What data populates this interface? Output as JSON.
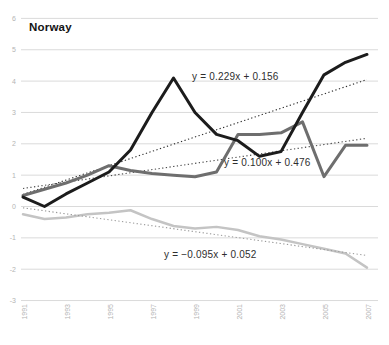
{
  "chart_data": {
    "type": "line",
    "title": "Norway",
    "x_axis": {
      "years": [
        1991,
        1992,
        1993,
        1994,
        1995,
        1996,
        1997,
        1998,
        1999,
        2000,
        2001,
        2002,
        2003,
        2004,
        2005,
        2006,
        2007
      ],
      "tick_labels": [
        "1991",
        "1993",
        "1995",
        "1997",
        "1999",
        "2001",
        "2003",
        "2005",
        "2007"
      ]
    },
    "y_axis": {
      "ticks": [
        6,
        5,
        4,
        3,
        2,
        1,
        0,
        -1,
        -2,
        -3
      ],
      "ylim": [
        -3,
        6
      ]
    },
    "grid": "horizontal",
    "series": [
      {
        "name": "series-black",
        "color": "#1c1c1c",
        "width": 3,
        "values": [
          0.3,
          0.0,
          0.4,
          0.75,
          1.1,
          1.8,
          3.0,
          4.1,
          3.0,
          2.3,
          2.1,
          1.6,
          1.75,
          3.0,
          4.2,
          4.6,
          4.85
        ],
        "trend": {
          "slope": 0.229,
          "intercept": 0.156,
          "label": "y = 0.229x + 0.156",
          "color": "#2e2e2e"
        }
      },
      {
        "name": "series-gray",
        "color": "#6e6e6e",
        "width": 3,
        "values": [
          0.35,
          0.55,
          0.75,
          1.0,
          1.3,
          1.15,
          1.05,
          1.0,
          0.95,
          1.1,
          2.3,
          2.3,
          2.35,
          2.7,
          0.95,
          1.95,
          1.95
        ],
        "trend": {
          "slope": 0.1,
          "intercept": 0.476,
          "label": "y = 0.100x + 0.476",
          "color": "#4a4a4a"
        }
      },
      {
        "name": "series-lightgray",
        "color": "#c4c4c4",
        "width": 2.5,
        "values": [
          -0.25,
          -0.4,
          -0.35,
          -0.25,
          -0.2,
          -0.12,
          -0.4,
          -0.62,
          -0.7,
          -0.65,
          -0.75,
          -0.95,
          -1.05,
          -1.2,
          -1.35,
          -1.5,
          -1.95
        ],
        "trend": {
          "slope": -0.095,
          "intercept": 0.052,
          "label": "y = −0.095x + 0.052",
          "color": "#9a9a9a"
        }
      }
    ]
  }
}
